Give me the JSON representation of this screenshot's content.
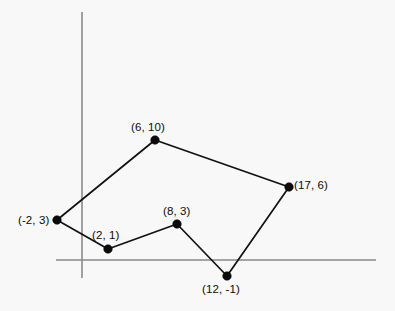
{
  "figure": {
    "background_color": "#f8f8f8",
    "axis_color": "#8a8a8a",
    "line_color": "#111111",
    "point_color": "#0b0b0b",
    "label_color": "#0b0b0b",
    "width": 395,
    "height": 311
  },
  "axes": {
    "x_axis_name": "x-axis",
    "y_axis_name": "y-axis",
    "x_axis": {
      "x1": 56,
      "y1": 260,
      "x2": 376,
      "y2": 260
    },
    "y_axis": {
      "x1": 82,
      "y1": 12,
      "x2": 82,
      "y2": 278
    }
  },
  "chart_data": {
    "type": "scatter",
    "title": "",
    "subtitle": "",
    "xlabel": "",
    "ylabel": "",
    "grid": false,
    "legend": "none",
    "shape": "closed-polygon",
    "axis_origin_px": {
      "x": 82,
      "y": 260
    },
    "units_per_px": {
      "x": 12.1,
      "y": 12.1
    },
    "xlim": [
      -3,
      19
    ],
    "ylim": [
      -3,
      12
    ],
    "vertices": [
      {
        "label": "(-2, 3)",
        "x": -2,
        "y": 3,
        "px": 57,
        "py": 220,
        "label_px": 18,
        "label_py": 214,
        "label_anchor": "right-of-none"
      },
      {
        "label": "(6, 10)",
        "x": 6,
        "y": 10,
        "px": 155,
        "py": 140,
        "label_px": 131,
        "label_py": 121,
        "label_anchor": "above"
      },
      {
        "label": "(17, 6)",
        "x": 17,
        "y": 6,
        "px": 289,
        "py": 187,
        "label_px": 294,
        "label_py": 179,
        "label_anchor": "right"
      },
      {
        "label": "(12, -1)",
        "x": 12,
        "y": -1,
        "px": 227,
        "py": 276,
        "label_px": 202,
        "label_py": 283,
        "label_anchor": "below"
      },
      {
        "label": "(8, 3)",
        "x": 8,
        "y": 3,
        "px": 177,
        "py": 224,
        "label_px": 163,
        "label_py": 205,
        "label_anchor": "above"
      },
      {
        "label": "(2, 1)",
        "x": 2,
        "y": 1,
        "px": 108,
        "py": 249,
        "label_px": 92,
        "label_py": 229,
        "label_anchor": "above-left"
      }
    ],
    "edges": [
      {
        "from": "(-2, 3)",
        "to": "(6, 10)"
      },
      {
        "from": "(6, 10)",
        "to": "(17, 6)"
      },
      {
        "from": "(17, 6)",
        "to": "(12, -1)"
      },
      {
        "from": "(12, -1)",
        "to": "(8, 3)"
      },
      {
        "from": "(8, 3)",
        "to": "(2, 1)"
      },
      {
        "from": "(2, 1)",
        "to": "(-2, 3)"
      }
    ],
    "point_radius_px": 4.3
  }
}
